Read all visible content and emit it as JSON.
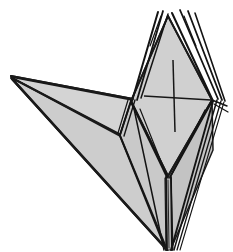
{
  "figure": {
    "title": "Folded paper model",
    "canvas": {
      "width": 233,
      "height": 252,
      "background": "#ffffff"
    },
    "palette": {
      "paper_light": "#d2d2d2",
      "paper_mid": "#c9c9c9",
      "paper_dark": "#bdbdbd",
      "paper_shadow": "#b2b2b2",
      "ink": "#1a1a1a",
      "background": "#ffffff"
    },
    "key_points": {
      "top_apex": [
        168,
        14
      ],
      "left_wing_tip": [
        11,
        77
      ],
      "bottom_tip": [
        168,
        250
      ],
      "left_diamond_vertex": [
        131,
        101
      ],
      "right_diamond_vertex": [
        212,
        100
      ],
      "wing_body_junction": [
        120,
        135
      ],
      "lower_waist": [
        168,
        176
      ]
    },
    "marks": {
      "cross_center": [
        174,
        98
      ],
      "cross_horizontal_span": [
        144,
        211
      ],
      "cross_vertical_span": [
        60,
        132
      ]
    },
    "facets": [
      {
        "name": "wing-upper",
        "fill": "#d2d2d2"
      },
      {
        "name": "wing-lower",
        "fill": "#c9c9c9"
      },
      {
        "name": "body-front-left",
        "fill": "#c9c9c9"
      },
      {
        "name": "body-front-right",
        "fill": "#c4c4c4"
      },
      {
        "name": "diamond-face",
        "fill": "#cfcfcf"
      },
      {
        "name": "tail-left",
        "fill": "#c9c9c9"
      },
      {
        "name": "tail-right",
        "fill": "#c2c2c2"
      }
    ],
    "pleat_counts": {
      "top_spikes": 6,
      "left_layers": 4,
      "right_layers": 5,
      "bottom_layers": 4
    }
  }
}
